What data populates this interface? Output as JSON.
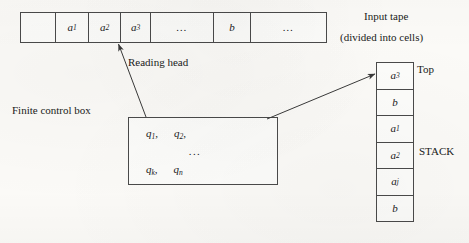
{
  "diagram": {
    "stroke_color": "#4a4a4a",
    "background_color": "#fbfaf7"
  },
  "tape": {
    "label": "Input tape",
    "sublabel": "(divided into cells)",
    "cells": [
      {
        "text": "",
        "width": 35
      },
      {
        "text": "a1",
        "width": 33
      },
      {
        "text": "a2",
        "width": 32
      },
      {
        "text": "a3",
        "width": 30
      },
      {
        "text": "...",
        "width": 63
      },
      {
        "text": "b",
        "width": 37
      },
      {
        "text": "...",
        "width": 75
      }
    ]
  },
  "reading_head": {
    "label": "Reading head"
  },
  "control_box": {
    "label": "Finite control box",
    "row1": [
      "q1",
      "q2"
    ],
    "dots": "...",
    "row2": [
      "qk",
      "qn"
    ]
  },
  "stack": {
    "label": "STACK",
    "top_label": "Top",
    "cells": [
      "a3",
      "b",
      "a1",
      "a2",
      "aj",
      "b"
    ]
  }
}
